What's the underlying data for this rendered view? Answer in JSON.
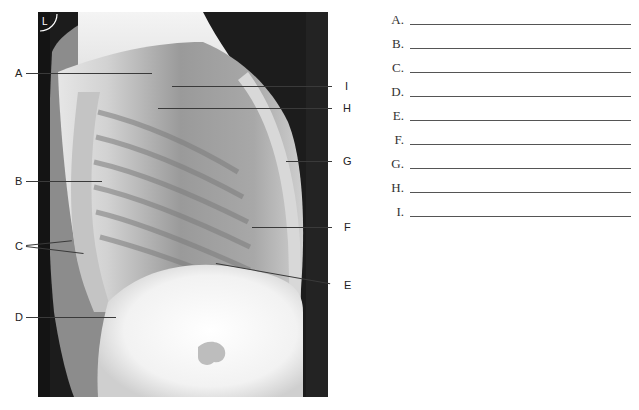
{
  "figure": {
    "type": "lateral chest radiograph",
    "badge_text": "L",
    "labels": [
      {
        "key": "A",
        "side": "left"
      },
      {
        "key": "B",
        "side": "left"
      },
      {
        "key": "C",
        "side": "left"
      },
      {
        "key": "D",
        "side": "left"
      },
      {
        "key": "E",
        "side": "right"
      },
      {
        "key": "F",
        "side": "right"
      },
      {
        "key": "G",
        "side": "right"
      },
      {
        "key": "H",
        "side": "right"
      },
      {
        "key": "I",
        "side": "right"
      }
    ]
  },
  "answers": [
    {
      "key": "A.",
      "value": ""
    },
    {
      "key": "B.",
      "value": ""
    },
    {
      "key": "C.",
      "value": ""
    },
    {
      "key": "D.",
      "value": ""
    },
    {
      "key": "E.",
      "value": ""
    },
    {
      "key": "F.",
      "value": ""
    },
    {
      "key": "G.",
      "value": ""
    },
    {
      "key": "H.",
      "value": ""
    },
    {
      "key": "I.",
      "value": ""
    }
  ]
}
